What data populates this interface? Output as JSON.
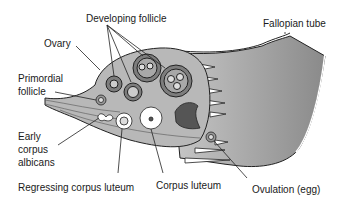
{
  "diagram": {
    "type": "anatomical-illustration",
    "labels": {
      "developing_follicle": "Developing follicle",
      "fallopian_tube": "Fallopian tube",
      "ovary": "Ovary",
      "primordial_follicle_line1": "Primordial",
      "primordial_follicle_line2": "follicle",
      "early_corpus_albicans_line1": "Early",
      "early_corpus_albicans_line2": "corpus",
      "early_corpus_albicans_line3": "albicans",
      "regressing_corpus_luteum": "Regressing corpus luteum",
      "corpus_luteum": "Corpus luteum",
      "ovulation_egg": "Ovulation (egg)"
    },
    "colors": {
      "background": "#ffffff",
      "line": "#222222",
      "tube_fill": "#9a9a9a",
      "ovary_fill": "#b5b5b5",
      "follicle_fill": "#7d7d7d",
      "text": "#1a1a1a"
    }
  }
}
